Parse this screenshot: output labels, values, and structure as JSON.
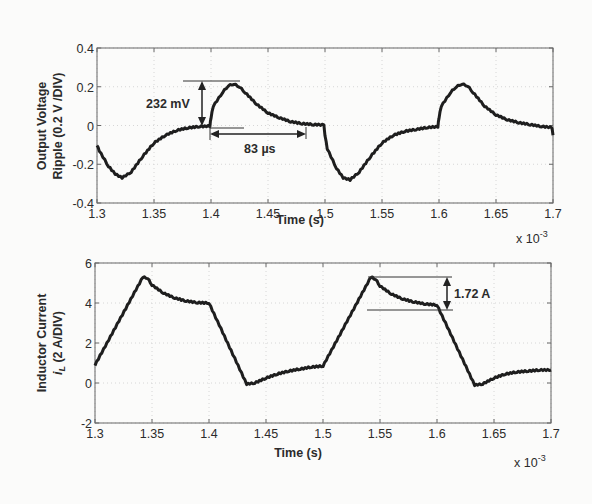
{
  "chart_data": [
    {
      "type": "line",
      "title": "",
      "xlabel": "Time (s)",
      "ylabel": "Output Voltage Ripple (0.2 V /DIV)",
      "x_multiplier": "x 10^-3",
      "xlim": [
        1.3,
        1.7
      ],
      "ylim": [
        -0.4,
        0.4
      ],
      "xticks": [
        "1.3",
        "1.35",
        "1.4",
        "1.45",
        "1.5",
        "1.55",
        "1.6",
        "1.65",
        "1.7"
      ],
      "yticks": [
        "0.4",
        "0.2",
        "0",
        "-0.2",
        "-0.4"
      ],
      "grid": true,
      "series": [
        {
          "name": "Output voltage ripple",
          "x": [
            1.3,
            1.302,
            1.31,
            1.316,
            1.322,
            1.33,
            1.34,
            1.35,
            1.36,
            1.37,
            1.38,
            1.39,
            1.399,
            1.4,
            1.402,
            1.41,
            1.415,
            1.42,
            1.425,
            1.43,
            1.44,
            1.45,
            1.46,
            1.47,
            1.48,
            1.49,
            1.499,
            1.5,
            1.502,
            1.51,
            1.516,
            1.522,
            1.53,
            1.54,
            1.55,
            1.56,
            1.57,
            1.58,
            1.59,
            1.599,
            1.6,
            1.602,
            1.61,
            1.615,
            1.62,
            1.625,
            1.63,
            1.64,
            1.65,
            1.66,
            1.67,
            1.68,
            1.69,
            1.699,
            1.7
          ],
          "y": [
            -0.1,
            -0.13,
            -0.21,
            -0.25,
            -0.27,
            -0.24,
            -0.16,
            -0.09,
            -0.05,
            -0.025,
            -0.012,
            -0.005,
            -0.003,
            0.04,
            0.1,
            0.17,
            0.205,
            0.215,
            0.2,
            0.17,
            0.11,
            0.065,
            0.04,
            0.02,
            0.01,
            0.005,
            0.003,
            -0.05,
            -0.12,
            -0.22,
            -0.27,
            -0.28,
            -0.24,
            -0.16,
            -0.09,
            -0.05,
            -0.03,
            -0.02,
            -0.01,
            -0.006,
            0.04,
            0.1,
            0.17,
            0.2,
            0.215,
            0.205,
            0.17,
            0.1,
            0.055,
            0.03,
            0.015,
            0.005,
            -0.005,
            -0.01,
            -0.05
          ]
        }
      ],
      "annotations": [
        {
          "text": "232 mV",
          "type": "vertical-arrow",
          "x": 1.397,
          "y_from": 0.0,
          "y_to": 0.232
        },
        {
          "text": "83 µs",
          "type": "horizontal-arrow",
          "y": -0.04,
          "x_from": 1.4,
          "x_to": 1.483
        }
      ]
    },
    {
      "type": "line",
      "title": "",
      "xlabel": "Time (s)",
      "ylabel": "Inductor Current i_L (2 A/DIV)",
      "x_multiplier": "x 10^-3",
      "xlim": [
        1.3,
        1.7
      ],
      "ylim": [
        -2,
        6
      ],
      "xticks": [
        "1.3",
        "1.35",
        "1.4",
        "1.45",
        "1.5",
        "1.55",
        "1.6",
        "1.65",
        "1.7"
      ],
      "yticks": [
        "6",
        "4",
        "2",
        "0",
        "-2"
      ],
      "grid": true,
      "series": [
        {
          "name": "Inductor current",
          "x": [
            1.3,
            1.342,
            1.346,
            1.35,
            1.36,
            1.37,
            1.38,
            1.39,
            1.4,
            1.433,
            1.44,
            1.45,
            1.46,
            1.47,
            1.48,
            1.49,
            1.5,
            1.542,
            1.546,
            1.55,
            1.56,
            1.57,
            1.58,
            1.59,
            1.6,
            1.633,
            1.64,
            1.65,
            1.66,
            1.67,
            1.68,
            1.69,
            1.7
          ],
          "y": [
            0.9,
            5.3,
            5.25,
            4.9,
            4.5,
            4.25,
            4.1,
            4.02,
            4.0,
            -0.05,
            0.0,
            0.25,
            0.45,
            0.6,
            0.7,
            0.8,
            0.85,
            5.3,
            5.2,
            4.85,
            4.45,
            4.2,
            4.05,
            3.95,
            3.9,
            -0.1,
            -0.05,
            0.25,
            0.45,
            0.55,
            0.6,
            0.65,
            0.65
          ]
        }
      ],
      "annotations": [
        {
          "text": "1.72 A",
          "type": "vertical-arrow",
          "x": 1.598,
          "y_from": 3.6,
          "y_to": 5.32
        }
      ]
    }
  ],
  "top": {
    "ylabel_line1": "Output Voltage",
    "ylabel_line2": "Ripple (0.2 V /DIV)",
    "xlabel": "Time (s)",
    "xmult": "x 10",
    "xmult_exp": "-3",
    "ann1": "232 mV",
    "ann2": "83 µs"
  },
  "bottom": {
    "ylabel_line1": "Inductor Current",
    "ylabel_line2_i": "i",
    "ylabel_line2_sub": "L",
    "ylabel_line2_rest": " (2 A/DIV)",
    "xlabel": "Time (s)",
    "xmult": "x 10",
    "xmult_exp": "-3",
    "ann1": "1.72 A"
  }
}
